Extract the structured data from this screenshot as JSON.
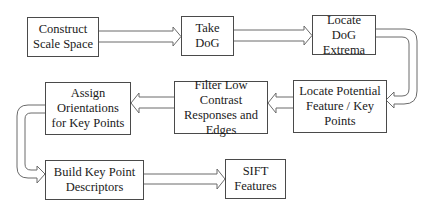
{
  "diagram": {
    "nodes": [
      {
        "id": "construct-scale-space",
        "label": "Construct\nScale Space"
      },
      {
        "id": "take-dog",
        "label": "Take\nDoG"
      },
      {
        "id": "locate-dog-extrema",
        "label": "Locate DoG\nExtrema"
      },
      {
        "id": "locate-potential-keypoints",
        "label": "Locate Potential\nFeature / Key\nPoints"
      },
      {
        "id": "filter-low-contrast",
        "label": "Filter Low Contrast\nResponses and\nEdges"
      },
      {
        "id": "assign-orientations",
        "label": "Assign\nOrientations\nfor Key Points"
      },
      {
        "id": "build-descriptors",
        "label": "Build Key Point\nDescriptors"
      },
      {
        "id": "sift-features",
        "label": "SIFT\nFeatures"
      }
    ],
    "edges": [
      {
        "from": "construct-scale-space",
        "to": "take-dog"
      },
      {
        "from": "take-dog",
        "to": "locate-dog-extrema"
      },
      {
        "from": "locate-dog-extrema",
        "to": "locate-potential-keypoints"
      },
      {
        "from": "locate-potential-keypoints",
        "to": "filter-low-contrast"
      },
      {
        "from": "filter-low-contrast",
        "to": "assign-orientations"
      },
      {
        "from": "assign-orientations",
        "to": "build-descriptors"
      },
      {
        "from": "build-descriptors",
        "to": "sift-features"
      }
    ],
    "colors": {
      "border": "#4a4a4a",
      "arrow": "#6a6a6a",
      "text": "#1a1a1a",
      "background": "#ffffff"
    }
  }
}
